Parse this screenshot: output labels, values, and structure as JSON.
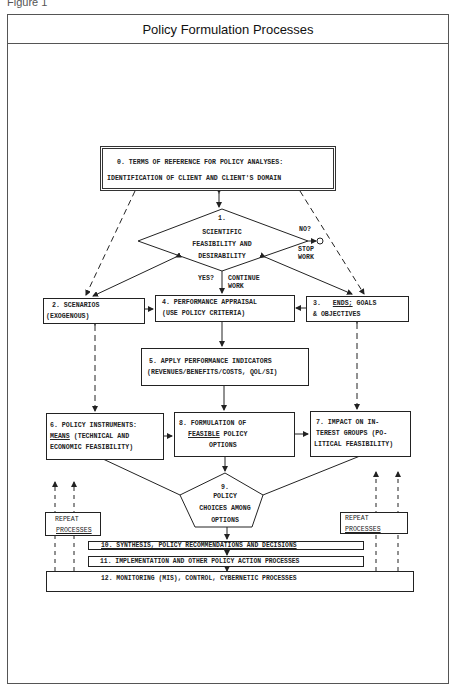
{
  "figure_label": "Figure 1",
  "title": "Policy Formulation Processes",
  "nodes": {
    "n0": {
      "line1": "0.  TERMS OF REFERENCE FOR POLICY ANALYSES:",
      "line2": "IDENTIFICATION OF CLIENT AND CLIENT'S DOMAIN"
    },
    "n1": {
      "num": "1.",
      "line1": "SCIENTIFIC",
      "line2": "FEASIBILITY AND",
      "line3": "DESIRABILITY"
    },
    "n2": {
      "line1": "2.   SCENARIOS",
      "line2": "(EXOGENOUS)"
    },
    "n3": {
      "num": "3.   ",
      "ends": "ENDS;",
      "line1_rest": " GOALS",
      "line2": "& OBJECTIVES"
    },
    "n4": {
      "line1": "4.   PERFORMANCE APPRAISAL",
      "line2": "(USE POLICY CRITERIA)"
    },
    "n5": {
      "line1": "5.  APPLY PERFORMANCE INDICATORS",
      "line2": "(REVENUES/BENEFITS/COSTS, QOL/SI)"
    },
    "n6": {
      "line1": "6.  POLICY INSTRUMENTS:",
      "means": "MEANS",
      "line2_rest": " (TECHNICAL AND",
      "line3": "ECONOMIC FEASIBILITY)"
    },
    "n7": {
      "line1": "7.  IMPACT ON IN-",
      "line2": "TEREST GROUPS (PO-",
      "line3": "LITICAL FEASIBILITY)"
    },
    "n8": {
      "line1": "8.  FORMULATION OF",
      "feasible": "FEASIBLE",
      "line2_rest": " POLICY",
      "line3": "OPTIONS"
    },
    "n9": {
      "num": "9.",
      "line1": "POLICY",
      "line2": "CHOICES AMONG",
      "line3": "OPTIONS"
    },
    "n10": {
      "label": "10.   SYNTHESIS, POLICY RECOMMENDATIONS AND DECISIONS"
    },
    "n11": {
      "label": "11.   IMPLEMENTATION AND OTHER POLICY ACTION PROCESSES"
    },
    "n12": {
      "label": "12.   MONITORING (MIS), CONTROL, CYBERNETIC PROCESSES"
    }
  },
  "edge_labels": {
    "no": "NO?",
    "stop_line1": "STOP",
    "stop_line2": "WORK",
    "yes": "YES?",
    "continue_line1": "CONTINUE",
    "continue_line2": "WORK"
  },
  "repeat_left": {
    "line1": "REPEAT",
    "line2": "PROCESSES"
  },
  "repeat_right": {
    "line1": "REPEAT",
    "line2": "PROCESSES"
  }
}
